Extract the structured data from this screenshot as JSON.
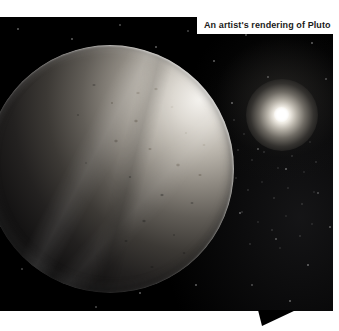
{
  "figure": {
    "caption": "An artist's rendering of Pluto",
    "subject": "Pluto",
    "alt": "An artist's rendering of Pluto — a heavily cratered icy dwarf planet lit from the upper right, with a distant bright Sun and a dense star field on a black background",
    "colors": {
      "page_background": "#ffffff",
      "photo_background": "#000000",
      "caption_background": "#ffffff",
      "caption_text": "#1a1a1a",
      "planet_highlight": "#f4f2ee",
      "planet_shadow": "#050505",
      "star_color": "#ffffff",
      "sun_core": "#ffffff"
    },
    "elements": {
      "planet_name": "planet-pluto",
      "star_name": "distant-sun",
      "starfield_name": "star-field",
      "notch_name": "caption-pointer-notch"
    }
  }
}
